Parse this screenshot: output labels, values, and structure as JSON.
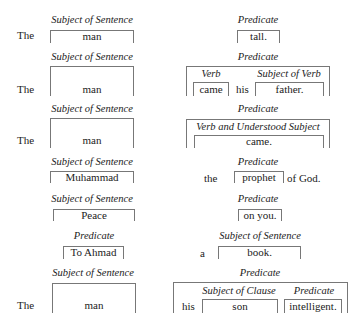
{
  "labels": {
    "subject_of_sentence": "Subject of Sentence",
    "predicate": "Predicate",
    "verb": "Verb",
    "subject_of_verb": "Subject of Verb",
    "verb_and_understood_subject": "Verb and Understood Subject",
    "subject_of_clause": "Subject of Clause"
  },
  "rows": [
    {
      "article": "The",
      "subject": "man",
      "predicate": "tall."
    },
    {
      "article": "The",
      "subject": "man",
      "verb": "came",
      "connector": "his",
      "verb_subject": "father."
    },
    {
      "article": "The",
      "subject": "man",
      "predicate": "came."
    },
    {
      "subject": "Muhammad",
      "pre": "the",
      "predicate": "prophet",
      "post": "of God."
    },
    {
      "subject": "Peace",
      "predicate": "on you."
    },
    {
      "predicate": "To Ahmad",
      "pre": "a",
      "subject": "book."
    },
    {
      "article": "The",
      "subject": "man",
      "connector": "his",
      "clause_subject": "son",
      "clause_predicate": "intelligent."
    }
  ]
}
